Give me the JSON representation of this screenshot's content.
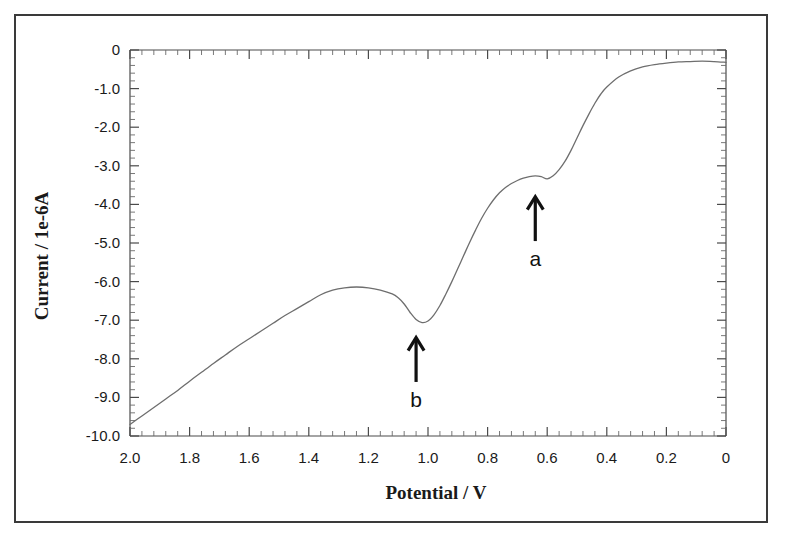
{
  "figure": {
    "background_color": "#ffffff",
    "frame_color": "#3a3a3a",
    "curve_color": "#6e6e6e",
    "text_color": "#1a1a1a"
  },
  "chart_data": {
    "type": "line",
    "title": "",
    "subtitle": "",
    "xlabel": "Potential / V",
    "ylabel": "Current / 1e-6A",
    "xlim": [
      2.0,
      0.0
    ],
    "ylim": [
      -10.0,
      0.0
    ],
    "x_axis_reversed": true,
    "grid": false,
    "legend": "none",
    "x_ticks": [
      "2.0",
      "1.8",
      "1.6",
      "1.4",
      "1.2",
      "1.0",
      "0.8",
      "0.6",
      "0.4",
      "0.2",
      "0"
    ],
    "x_tick_values": [
      2.0,
      1.8,
      1.6,
      1.4,
      1.2,
      1.0,
      0.8,
      0.6,
      0.4,
      0.2,
      0.0
    ],
    "x_minor_tick_count": 4,
    "y_ticks": [
      "0",
      "-1.0",
      "-2.0",
      "-3.0",
      "-4.0",
      "-5.0",
      "-6.0",
      "-7.0",
      "-8.0",
      "-9.0",
      "-10.0"
    ],
    "y_tick_values": [
      0.0,
      -1.0,
      -2.0,
      -3.0,
      -4.0,
      -5.0,
      -6.0,
      -7.0,
      -8.0,
      -9.0,
      -10.0
    ],
    "y_minor_tick_count": 4,
    "series": [
      {
        "name": "voltammogram",
        "x": [
          2.0,
          1.96,
          1.92,
          1.88,
          1.84,
          1.8,
          1.76,
          1.72,
          1.68,
          1.64,
          1.6,
          1.56,
          1.52,
          1.48,
          1.44,
          1.4,
          1.36,
          1.32,
          1.28,
          1.24,
          1.2,
          1.16,
          1.12,
          1.1,
          1.08,
          1.06,
          1.04,
          1.02,
          1.0,
          0.98,
          0.96,
          0.94,
          0.92,
          0.9,
          0.88,
          0.86,
          0.84,
          0.82,
          0.8,
          0.78,
          0.76,
          0.74,
          0.72,
          0.7,
          0.68,
          0.66,
          0.64,
          0.62,
          0.6,
          0.58,
          0.56,
          0.54,
          0.52,
          0.5,
          0.48,
          0.46,
          0.44,
          0.42,
          0.4,
          0.36,
          0.32,
          0.28,
          0.24,
          0.2,
          0.16,
          0.12,
          0.08,
          0.04,
          0.0
        ],
        "y": [
          -9.7,
          -9.48,
          -9.26,
          -9.04,
          -8.82,
          -8.58,
          -8.35,
          -8.12,
          -7.9,
          -7.68,
          -7.48,
          -7.28,
          -7.08,
          -6.88,
          -6.7,
          -6.52,
          -6.34,
          -6.22,
          -6.16,
          -6.14,
          -6.16,
          -6.22,
          -6.32,
          -6.42,
          -6.58,
          -6.8,
          -6.98,
          -7.06,
          -7.02,
          -6.86,
          -6.62,
          -6.32,
          -6.0,
          -5.66,
          -5.32,
          -4.98,
          -4.66,
          -4.36,
          -4.1,
          -3.88,
          -3.7,
          -3.56,
          -3.46,
          -3.38,
          -3.32,
          -3.28,
          -3.26,
          -3.28,
          -3.34,
          -3.26,
          -3.1,
          -2.88,
          -2.6,
          -2.28,
          -1.96,
          -1.66,
          -1.38,
          -1.14,
          -0.96,
          -0.7,
          -0.54,
          -0.44,
          -0.38,
          -0.34,
          -0.31,
          -0.3,
          -0.29,
          -0.3,
          -0.32
        ]
      }
    ],
    "annotations": [
      {
        "label": "a",
        "description": "arrow marking shoulder wave a",
        "x": 0.64,
        "y_arrow_tip": -3.8,
        "y_arrow_base": -4.95,
        "y_label": -5.45
      },
      {
        "label": "b",
        "description": "arrow marking cathodic peak b",
        "x": 1.04,
        "y_arrow_tip": -7.45,
        "y_arrow_base": -8.6,
        "y_label": -9.1
      }
    ]
  }
}
